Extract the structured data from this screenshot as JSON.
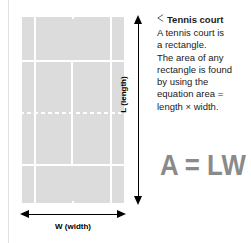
{
  "diagram": {
    "court": {
      "name": "tennis-court",
      "surface_color": "#dcdcdc",
      "line_color": "#ffffff",
      "net_style": "dashed"
    },
    "dimensions": {
      "vertical_label": "L (length)",
      "horizontal_label": "W (width)",
      "arrow_color": "#000000"
    }
  },
  "caption": {
    "marker": "◁",
    "title": "Tennis court",
    "body": "A tennis court is a rectangle. The area of any rectangle is found by using the equation area = length × width.",
    "lines": [
      "A tennis court is",
      "a rectangle.",
      "The area of any",
      "rectangle is found",
      "by using the",
      "equation area =",
      "length × width."
    ]
  },
  "formula": {
    "text": "A = LW",
    "color": "#8a8a8a"
  }
}
